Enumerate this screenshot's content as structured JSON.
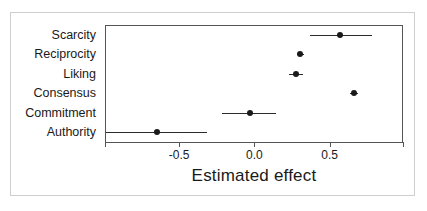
{
  "figure": {
    "background": "#ffffff",
    "frame_color": "#cfcfcf",
    "axis_color": "#555555",
    "point_color": "#1a1a1a"
  },
  "chart_data": {
    "type": "scatter",
    "title": "",
    "subtitle": "",
    "xlabel": "Estimated effect",
    "ylabel": "",
    "grid": false,
    "legend": "none",
    "orientation": "horizontal",
    "xlim": [
      -0.993,
      0.987
    ],
    "xticks": [
      -0.5,
      0.0,
      0.5
    ],
    "xticklabels": [
      "-0.5",
      "0.0",
      "0.5"
    ],
    "categories": [
      "Scarcity",
      "Reciprocity",
      "Liking",
      "Consensus",
      "Commitment",
      "Authority"
    ],
    "values": [
      0.567,
      0.303,
      0.273,
      0.66,
      -0.027,
      -0.647
    ],
    "ci_low": [
      0.367,
      0.283,
      0.227,
      0.633,
      -0.213,
      -0.987
    ],
    "ci_high": [
      0.78,
      0.327,
      0.32,
      0.687,
      0.14,
      -0.313
    ],
    "series": [
      {
        "name": "Estimated effect",
        "points": [
          {
            "category": "Scarcity",
            "estimate": 0.567,
            "low": 0.367,
            "high": 0.78
          },
          {
            "category": "Reciprocity",
            "estimate": 0.303,
            "low": 0.283,
            "high": 0.327
          },
          {
            "category": "Liking",
            "estimate": 0.273,
            "low": 0.227,
            "high": 0.32
          },
          {
            "category": "Consensus",
            "estimate": 0.66,
            "low": 0.633,
            "high": 0.687
          },
          {
            "category": "Commitment",
            "estimate": -0.027,
            "low": -0.213,
            "high": 0.14
          },
          {
            "category": "Authority",
            "estimate": -0.647,
            "low": -0.987,
            "high": -0.313
          }
        ]
      }
    ]
  }
}
